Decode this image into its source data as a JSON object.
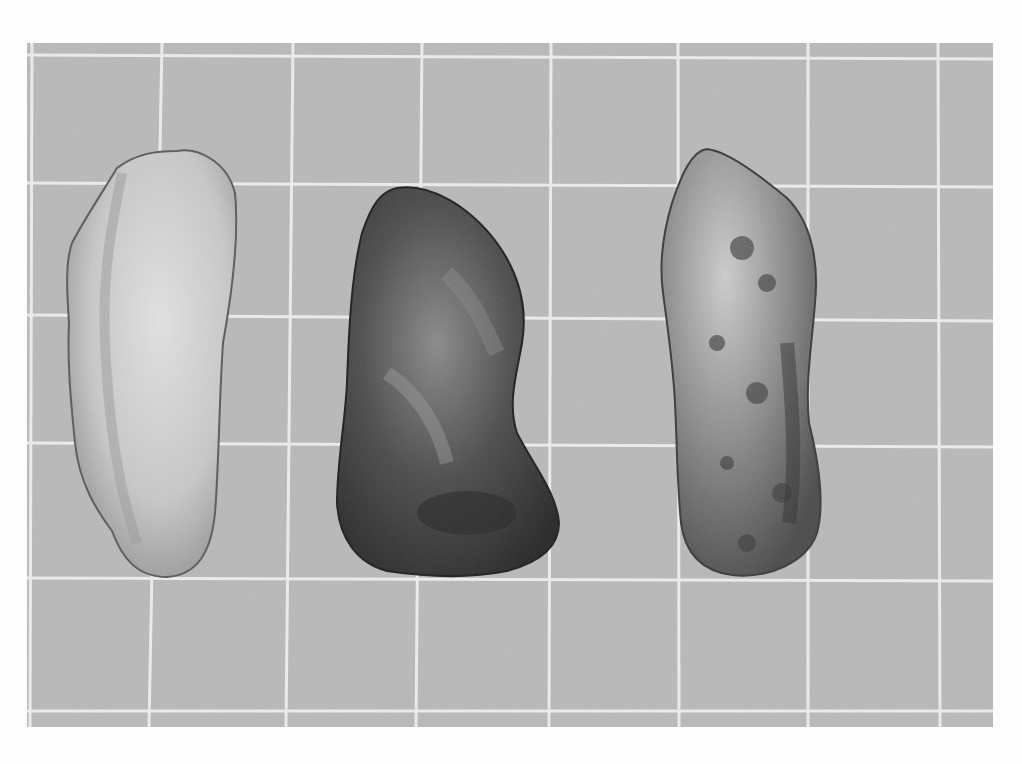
{
  "image": {
    "subject": "Three stone flake tools photographed on a grid background",
    "style": "black-and-white photograph",
    "background_color": "#fdfdfd",
    "grid_fill_color": "#b9b9b9",
    "grid_line_color": "#ececec",
    "artifacts": [
      {
        "position": "left",
        "tone": "light gray",
        "color": "#cfcfcf"
      },
      {
        "position": "center",
        "tone": "dark",
        "color": "#4a4a4a"
      },
      {
        "position": "right",
        "tone": "mottled gray",
        "color": "#9a9a9a"
      }
    ]
  }
}
